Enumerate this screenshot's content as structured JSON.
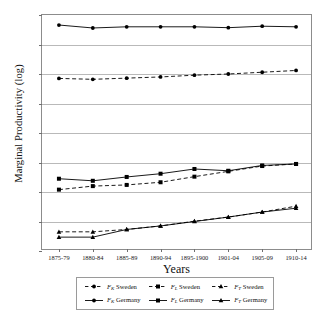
{
  "chart_data": {
    "type": "line",
    "title": "",
    "xlabel": "Years",
    "ylabel": "Marginal Productivity (log)",
    "categories": [
      "1875-79",
      "1880-84",
      "1885-89",
      "1890-94",
      "1895-1900",
      "1901-04",
      "1905-09",
      "1910-14"
    ],
    "ylim": [
      -3,
      5
    ],
    "yticks": [
      5,
      4,
      3,
      2,
      1,
      0,
      -1,
      -2,
      -3
    ],
    "ytick_labels": [
      "5",
      "4",
      "3",
      "2",
      "1",
      "0",
      "-1",
      "-2",
      "-3"
    ],
    "grid": "horizontal",
    "legend_position": "below-plot",
    "series": [
      {
        "name": "Fk Sweden",
        "label_base": "F",
        "label_sub": "K",
        "label_country": "Sweden",
        "linestyle": "dashed",
        "marker": "circle",
        "color": "#000000",
        "values": [
          2.85,
          2.82,
          2.86,
          2.9,
          2.96,
          3.0,
          3.06,
          3.12
        ]
      },
      {
        "name": "Fk Germany",
        "label_base": "F",
        "label_sub": "K",
        "label_country": "Germany",
        "linestyle": "solid",
        "marker": "circle",
        "color": "#000000",
        "values": [
          4.66,
          4.56,
          4.6,
          4.6,
          4.6,
          4.57,
          4.62,
          4.6
        ]
      },
      {
        "name": "Fl Sweden",
        "label_base": "F",
        "label_sub": "L",
        "label_country": "Sweden",
        "linestyle": "dashed",
        "marker": "square",
        "color": "#000000",
        "values": [
          -0.92,
          -0.8,
          -0.76,
          -0.67,
          -0.48,
          -0.3,
          -0.12,
          -0.05
        ]
      },
      {
        "name": "Fl Germany",
        "label_base": "F",
        "label_sub": "L",
        "label_country": "Germany",
        "linestyle": "solid",
        "marker": "square",
        "color": "#000000",
        "values": [
          -0.55,
          -0.62,
          -0.49,
          -0.38,
          -0.22,
          -0.28,
          -0.1,
          -0.05
        ]
      },
      {
        "name": "Ft Sweden",
        "label_base": "F",
        "label_sub": "T",
        "label_country": "Sweden",
        "linestyle": "dashed",
        "marker": "triangle",
        "color": "#000000",
        "values": [
          -2.35,
          -2.35,
          -2.27,
          -2.15,
          -1.99,
          -1.85,
          -1.68,
          -1.48
        ]
      },
      {
        "name": "Ft Germany",
        "label_base": "F",
        "label_sub": "T",
        "label_country": "Germany",
        "linestyle": "solid",
        "marker": "triangle",
        "color": "#000000",
        "values": [
          -2.53,
          -2.53,
          -2.27,
          -2.15,
          -2.0,
          -1.85,
          -1.68,
          -1.55
        ]
      }
    ]
  },
  "legend": {
    "items": [
      {
        "base": "F",
        "sub": "K",
        "country": "Sweden"
      },
      {
        "base": "F",
        "sub": "L",
        "country": "Sweden"
      },
      {
        "base": "F",
        "sub": "T",
        "country": "Sweden"
      },
      {
        "base": "F",
        "sub": "K",
        "country": "Germany"
      },
      {
        "base": "F",
        "sub": "L",
        "country": "Germany"
      },
      {
        "base": "F",
        "sub": "T",
        "country": "Germany"
      }
    ]
  }
}
